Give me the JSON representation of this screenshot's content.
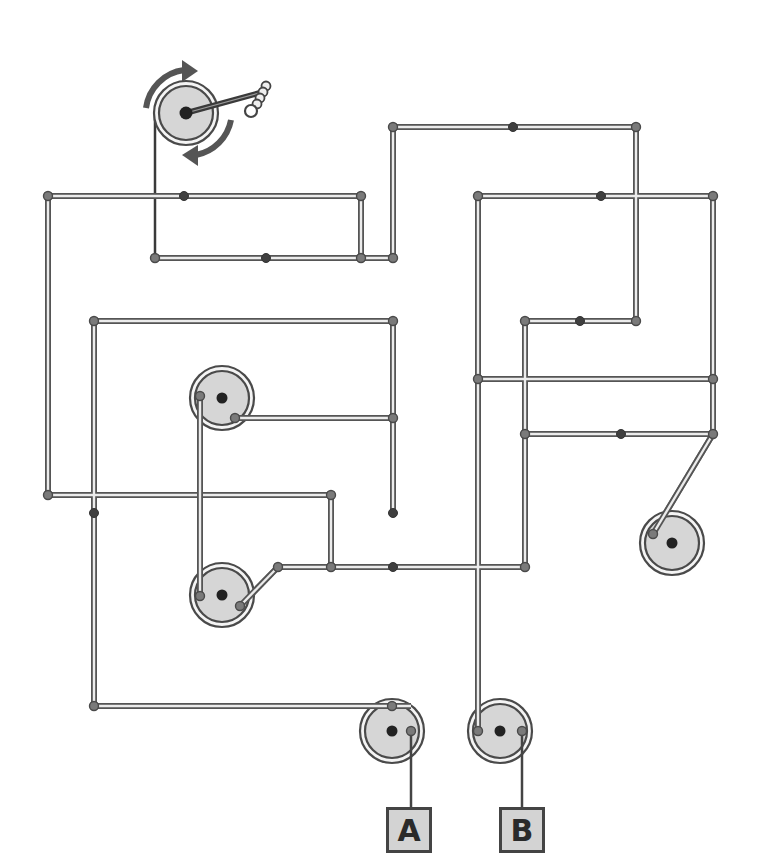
{
  "diagram": {
    "type": "pulley-rope puzzle",
    "crank": {
      "center": [
        186,
        113
      ],
      "radius": 30,
      "rotation_arrows": "clockwise (top arrow right, bottom arrow left)",
      "handle_tip": [
        262,
        95
      ]
    },
    "pulleys": [
      {
        "id": "p1",
        "center": [
          222,
          398
        ],
        "radius": 31
      },
      {
        "id": "p2",
        "center": [
          222,
          595
        ],
        "radius": 31
      },
      {
        "id": "p3",
        "center": [
          672,
          543
        ],
        "radius": 31
      },
      {
        "id": "p4",
        "center": [
          392,
          731
        ],
        "radius": 31
      },
      {
        "id": "p5",
        "center": [
          500,
          731
        ],
        "radius": 31
      }
    ],
    "outputs": [
      {
        "label": "A",
        "box": [
          386,
          807
        ]
      },
      {
        "label": "B",
        "box": [
          500,
          807
        ]
      }
    ]
  },
  "outputs": {
    "a_label": "A",
    "b_label": "B"
  },
  "colors": {
    "wire_outline": "#555555",
    "wire_fill": "#ececec",
    "pulley_fill": "#d6d6d6",
    "joint_dot": "#7a7a7a",
    "mid_dot": "#3f3f3f",
    "label_fill": "#d3d3d3"
  }
}
